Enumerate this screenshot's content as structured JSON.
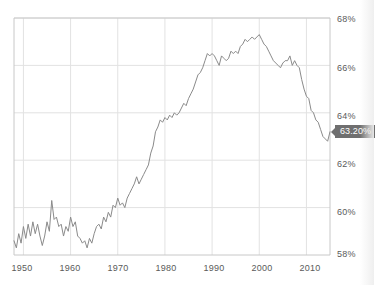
{
  "chart_data": {
    "type": "line",
    "title": "",
    "xlabel": "",
    "ylabel": "",
    "xlim": [
      1948,
      2015
    ],
    "ylim": [
      58,
      68
    ],
    "grid": true,
    "legend": null,
    "y_ticks": [
      "58%",
      "60%",
      "62%",
      "64%",
      "66%",
      "68%"
    ],
    "y_tick_values": [
      58,
      60,
      62,
      64,
      66,
      68
    ],
    "x_ticks": [
      "1950",
      "1960",
      "1970",
      "1980",
      "1990",
      "2000",
      "2010"
    ],
    "x_tick_values": [
      1950,
      1960,
      1970,
      1980,
      1990,
      2000,
      2010
    ],
    "line_color": "#8a8a8a",
    "grid_color": "#e2e2e2",
    "axis_color": "#c8c8c8",
    "annotation": {
      "label": "63.20%",
      "value": 63.2,
      "x": 2015,
      "background": "#6f6f6f",
      "text_color": "#ffffff"
    },
    "series": [
      {
        "name": "Labor Force Participation Rate",
        "x": [
          1948.0,
          1948.5,
          1949.0,
          1949.5,
          1950.0,
          1950.5,
          1951.0,
          1951.5,
          1952.0,
          1952.5,
          1953.0,
          1953.5,
          1954.0,
          1954.5,
          1955.0,
          1955.5,
          1956.0,
          1956.5,
          1957.0,
          1957.5,
          1958.0,
          1958.5,
          1959.0,
          1959.5,
          1960.0,
          1960.5,
          1961.0,
          1961.5,
          1962.0,
          1962.5,
          1963.0,
          1963.5,
          1964.0,
          1964.5,
          1965.0,
          1965.5,
          1966.0,
          1966.5,
          1967.0,
          1967.5,
          1968.0,
          1968.5,
          1969.0,
          1969.5,
          1970.0,
          1970.5,
          1971.0,
          1971.5,
          1972.0,
          1972.5,
          1973.0,
          1973.5,
          1974.0,
          1974.5,
          1975.0,
          1975.5,
          1976.0,
          1976.5,
          1977.0,
          1977.5,
          1978.0,
          1978.5,
          1979.0,
          1979.5,
          1980.0,
          1980.5,
          1981.0,
          1981.5,
          1982.0,
          1982.5,
          1983.0,
          1983.5,
          1984.0,
          1984.5,
          1985.0,
          1985.5,
          1986.0,
          1986.5,
          1987.0,
          1987.5,
          1988.0,
          1988.5,
          1989.0,
          1989.5,
          1990.0,
          1990.5,
          1991.0,
          1991.5,
          1992.0,
          1992.5,
          1993.0,
          1993.5,
          1994.0,
          1994.5,
          1995.0,
          1995.5,
          1996.0,
          1996.5,
          1997.0,
          1997.5,
          1998.0,
          1998.5,
          1999.0,
          1999.5,
          2000.0,
          2000.5,
          2001.0,
          2001.5,
          2002.0,
          2002.5,
          2003.0,
          2003.5,
          2004.0,
          2004.5,
          2005.0,
          2005.5,
          2006.0,
          2006.5,
          2007.0,
          2007.5,
          2008.0,
          2008.5,
          2009.0,
          2009.5,
          2010.0,
          2010.5,
          2011.0,
          2011.5,
          2012.0,
          2012.5,
          2013.0,
          2013.5,
          2014.0,
          2014.5,
          2015.0
        ],
        "y": [
          58.6,
          58.3,
          58.9,
          58.5,
          59.2,
          58.7,
          59.3,
          58.8,
          59.4,
          58.9,
          59.3,
          58.8,
          58.4,
          58.8,
          59.4,
          59.0,
          60.3,
          59.5,
          59.6,
          59.2,
          59.3,
          58.8,
          59.2,
          59.0,
          59.6,
          59.2,
          59.4,
          58.8,
          58.7,
          58.5,
          58.6,
          58.3,
          58.7,
          58.5,
          58.9,
          59.2,
          59.3,
          59.1,
          59.6,
          59.4,
          59.8,
          59.6,
          60.1,
          60.0,
          60.4,
          60.1,
          60.2,
          60.0,
          60.4,
          60.6,
          60.8,
          61.0,
          61.3,
          61.0,
          61.2,
          61.4,
          61.6,
          61.8,
          62.3,
          62.6,
          63.2,
          63.4,
          63.7,
          63.6,
          63.8,
          63.7,
          63.9,
          63.8,
          64.0,
          63.9,
          64.0,
          64.2,
          64.4,
          64.3,
          64.6,
          64.8,
          65.0,
          65.3,
          65.6,
          65.7,
          65.9,
          66.2,
          66.5,
          66.4,
          66.5,
          66.4,
          66.2,
          66.0,
          66.4,
          66.3,
          66.2,
          66.3,
          66.6,
          66.5,
          66.6,
          66.5,
          66.8,
          66.9,
          67.1,
          67.0,
          67.1,
          67.2,
          67.1,
          67.2,
          67.3,
          67.1,
          66.9,
          66.8,
          66.6,
          66.4,
          66.2,
          66.1,
          66.0,
          65.9,
          66.1,
          66.2,
          66.2,
          66.4,
          66.0,
          66.2,
          66.0,
          65.9,
          65.4,
          65.0,
          64.7,
          64.6,
          64.1,
          64.0,
          63.7,
          63.6,
          63.3,
          63.0,
          62.9,
          62.8,
          63.2
        ]
      }
    ]
  },
  "axis": {
    "y_labels": [
      {
        "text": "68%",
        "top": 14
      },
      {
        "text": "66%",
        "top": 63
      },
      {
        "text": "64%",
        "top": 111
      },
      {
        "text": "62%",
        "top": 159
      },
      {
        "text": "60%",
        "top": 207
      },
      {
        "text": "58%",
        "top": 249
      }
    ],
    "x_labels": [
      {
        "text": "1950",
        "left": 22
      },
      {
        "text": "1960",
        "left": 70
      },
      {
        "text": "1970",
        "left": 118
      },
      {
        "text": "1980",
        "left": 166
      },
      {
        "text": "1990",
        "left": 214
      },
      {
        "text": "2000",
        "left": 262
      },
      {
        "text": "2010",
        "left": 310
      }
    ]
  },
  "callout": {
    "label": "63.20%"
  }
}
